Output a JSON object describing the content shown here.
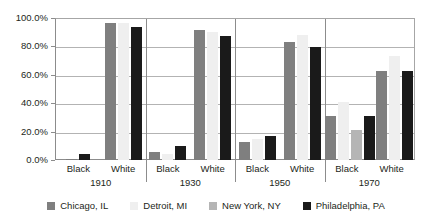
{
  "chart_data": {
    "type": "bar",
    "title": "",
    "subtitle": "",
    "xlabel": "",
    "ylabel": "",
    "ylim": [
      0,
      100
    ],
    "ytick_labels": [
      "0.0%",
      "20.0%",
      "40.0%",
      "60.0%",
      "80.0%",
      "100.0%"
    ],
    "ytick_values": [
      0,
      20,
      40,
      60,
      80,
      100
    ],
    "grid": true,
    "legend_position": "bottom",
    "categories": [
      "1910 Black",
      "1910 White",
      "1930 Black",
      "1930 White",
      "1950 Black",
      "1950 White",
      "1970 Black",
      "1970 White"
    ],
    "group_years": [
      "1910",
      "1930",
      "1950",
      "1970"
    ],
    "group_races": [
      "Black",
      "White"
    ],
    "series": [
      {
        "name": "Chicago, IL",
        "color": "#7f7f7f",
        "values": [
          1.0,
          97.0,
          6.0,
          92.0,
          13.0,
          84.0,
          31.0,
          63.0
        ]
      },
      {
        "name": "Detroit, MI",
        "color": "#efefef",
        "values": [
          0.0,
          97.0,
          4.0,
          91.0,
          15.0,
          89.0,
          41.0,
          74.0
        ]
      },
      {
        "name": "New York, NY",
        "color": "#b5b5b5",
        "values": [
          0.0,
          0.0,
          0.0,
          0.0,
          0.0,
          0.0,
          21.0,
          0.0
        ]
      },
      {
        "name": "Philadelphia, PA",
        "color": "#1a1a1a",
        "values": [
          4.0,
          94.0,
          10.0,
          88.0,
          17.0,
          80.0,
          31.0,
          63.0
        ]
      }
    ]
  },
  "y_axis": {
    "ticks": [
      {
        "label": "100.0%",
        "value": 100
      },
      {
        "label": "80.0%",
        "value": 80
      },
      {
        "label": "60.0%",
        "value": 60
      },
      {
        "label": "40.0%",
        "value": 40
      },
      {
        "label": "20.0%",
        "value": 20
      },
      {
        "label": "0.0%",
        "value": 0
      }
    ]
  },
  "x_axis": {
    "groups": [
      {
        "year": "1910",
        "races": [
          "Black",
          "White"
        ]
      },
      {
        "year": "1930",
        "races": [
          "Black",
          "White"
        ]
      },
      {
        "year": "1950",
        "races": [
          "Black",
          "White"
        ]
      },
      {
        "year": "1970",
        "races": [
          "Black",
          "White"
        ]
      }
    ]
  },
  "legend": {
    "items": [
      {
        "label": "Chicago, IL",
        "color": "#7f7f7f"
      },
      {
        "label": "Detroit, MI",
        "color": "#efefef"
      },
      {
        "label": "New York, NY",
        "color": "#b5b5b5"
      },
      {
        "label": "Philadelphia, PA",
        "color": "#1a1a1a"
      }
    ]
  }
}
